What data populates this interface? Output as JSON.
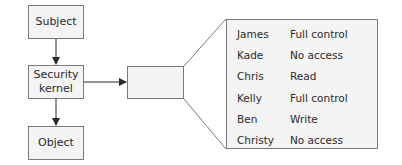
{
  "flow": {
    "subject": "Subject",
    "kernel_line1": "Security",
    "kernel_line2": "kernel",
    "object": "Object"
  },
  "access_list": {
    "rows": [
      {
        "name": "James",
        "permission": "Full control"
      },
      {
        "name": "Kade",
        "permission": "No access"
      },
      {
        "name": "Chris",
        "permission": "Read"
      },
      {
        "name": "Kelly",
        "permission": "Full control"
      },
      {
        "name": "Ben",
        "permission": "Write"
      },
      {
        "name": "Christy",
        "permission": "No access"
      }
    ]
  },
  "colors": {
    "box_fill": "#f4f4f4",
    "border": "#7a7a7a",
    "arrow": "#2a2a2a"
  }
}
